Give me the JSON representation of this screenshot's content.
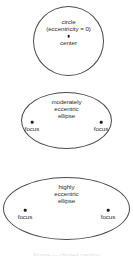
{
  "figure": {
    "background_color": "#ffffff",
    "stroke_color": "#4a4a4a",
    "dot_color": "#1c1c1c",
    "text_color": "#2b2b2b"
  },
  "shapes": [
    {
      "id": "circle",
      "kind": "circle",
      "label_lines": [
        "circle",
        "(eccentricity = 0)"
      ],
      "points": [
        {
          "name": "center",
          "label": "center"
        }
      ]
    },
    {
      "id": "moderate-ellipse",
      "kind": "ellipse",
      "label_lines": [
        "moderately",
        "eccentric",
        "ellipse"
      ],
      "points": [
        {
          "name": "focus-left",
          "label": "focus"
        },
        {
          "name": "focus-right",
          "label": "focus"
        }
      ]
    },
    {
      "id": "high-ellipse",
      "kind": "ellipse",
      "label_lines": [
        "highly",
        "eccentric",
        "ellipse"
      ],
      "points": [
        {
          "name": "focus-left",
          "label": "focus"
        },
        {
          "name": "focus-right",
          "label": "focus"
        }
      ]
    }
  ],
  "caption": {
    "remnant_text": "Figure — clipped caption"
  }
}
